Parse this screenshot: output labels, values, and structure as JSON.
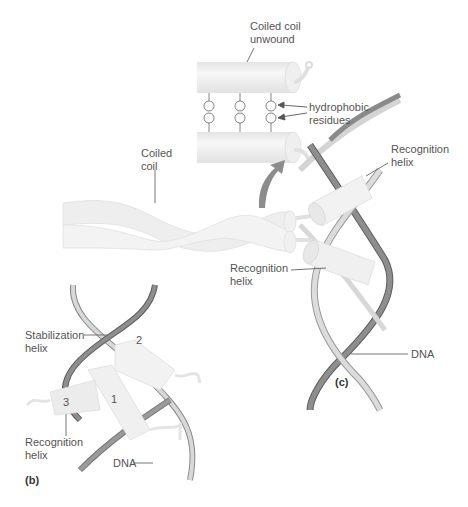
{
  "colors": {
    "helix_fill": "#ececec",
    "helix_highlight": "#f6f6f6",
    "helix_edge": "#d8d8d8",
    "dna_dark": "#8a8a8a",
    "dna_light": "#d6d6d6",
    "dna_edge": "#5e5e5e",
    "leader": "#666666",
    "arrow": "#8c8c8c",
    "text": "#555555"
  },
  "panel_c": {
    "label": "(c)",
    "annotations": {
      "coiled_coil_unwound": "Coiled coil\nunwound",
      "hydrophobic_residues": "hydrophobic\nresidues",
      "coiled_coil": "Coiled\ncoil",
      "recognition_helix_upper": "Recognition\nhelix",
      "recognition_helix_lower": "Recognition\nhelix",
      "dna": "DNA"
    },
    "residue_pairs": 3
  },
  "panel_b": {
    "label": "(b)",
    "annotations": {
      "stabilization_helix": "Stabilization\nhelix",
      "recognition_helix": "Recognition\nhelix",
      "dna": "DNA"
    },
    "helix_numbers": [
      "1",
      "2",
      "3"
    ]
  }
}
